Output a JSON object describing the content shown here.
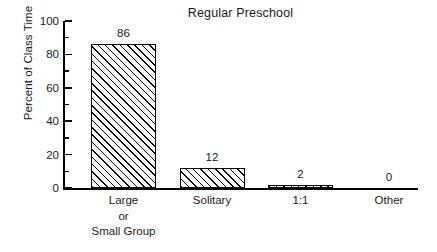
{
  "chart_data": {
    "type": "bar",
    "title": "Regular Preschool",
    "xlabel": "",
    "ylabel": "Percent of Class Time",
    "categories": [
      "Large\nor\nSmall Group",
      "Solitary",
      "1:1",
      "Other"
    ],
    "category_lines": [
      [
        "Large",
        "or",
        "Small Group"
      ],
      [
        "Solitary"
      ],
      [
        "1:1"
      ],
      [
        "Other"
      ]
    ],
    "values": [
      86,
      12,
      2,
      0
    ],
    "value_labels": [
      "86",
      "12",
      "2",
      "0"
    ],
    "ylim": [
      0,
      100
    ],
    "yticks": [
      0,
      20,
      40,
      60,
      80,
      100
    ],
    "ytick_labels": [
      "0",
      "20",
      "40",
      "60",
      "80",
      "100"
    ],
    "yminor_ticks": [
      10,
      30,
      50,
      70,
      90
    ],
    "grid": false,
    "legend": null,
    "bar_style": {
      "fill": "#ffffff",
      "hatch": "/",
      "edge_color": "#000000"
    },
    "axis_color": "#000000",
    "text_color": "#1a1a1a",
    "background": "#ffffff"
  },
  "title": {
    "text": "Regular Preschool"
  },
  "y_axis": {
    "label": "Percent of Class Time"
  }
}
